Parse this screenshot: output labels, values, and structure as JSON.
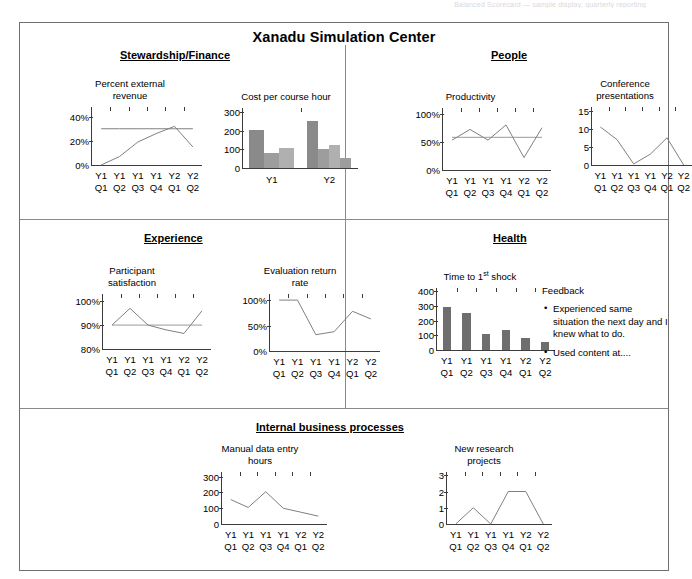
{
  "faint_header": "Balanced Scorecard — sample display, quarterly reporting",
  "dashboard": {
    "title": "Xanadu Simulation Center",
    "sections": [
      {
        "id": "stewardship",
        "label": "Stewardship/Finance"
      },
      {
        "id": "people",
        "label": "People"
      },
      {
        "id": "experience",
        "label": "Experience"
      },
      {
        "id": "health",
        "label": "Health"
      },
      {
        "id": "internal",
        "label": "Internal business processes"
      }
    ]
  },
  "feedback": {
    "title": "Feedback",
    "items": [
      "Experienced same situation the next day and I knew what to do.",
      "Used content at...."
    ]
  },
  "chart_data": [
    {
      "id": "percent-external-revenue",
      "type": "line",
      "title": "Percent external\nrevenue",
      "categories": [
        "Y1\nQ1",
        "Y1\nQ2",
        "Y1\nQ3",
        "Y1\nQ4",
        "Y2\nQ1",
        "Y2\nQ2"
      ],
      "yticks": [
        0,
        20,
        40
      ],
      "yticklabels": [
        "0%",
        "20%",
        "40%"
      ],
      "ylim": [
        0,
        48
      ],
      "series": [
        {
          "name": "target",
          "values": [
            30,
            30,
            30,
            30,
            30,
            30
          ],
          "color": "#808080"
        },
        {
          "name": "actual",
          "values": [
            0,
            7,
            19,
            26,
            32,
            15
          ],
          "color": "#808080"
        }
      ]
    },
    {
      "id": "cost-per-course-hour",
      "type": "bar",
      "title": "Cost per course hour",
      "categories": [
        "Y1",
        "Y2"
      ],
      "yticks": [
        0,
        100,
        200,
        300
      ],
      "yticklabels": [
        "0",
        "100",
        "200",
        "300"
      ],
      "ylim": [
        0,
        320
      ],
      "groups": [
        {
          "name": "Y1",
          "values": [
            205,
            80,
            105
          ],
          "colors": [
            "#8a8a8a",
            "#9d9d9d",
            "#b0b0b0"
          ]
        },
        {
          "name": "Y2",
          "values": [
            250,
            103,
            125,
            55
          ],
          "colors": [
            "#8a8a8a",
            "#9d9d9d",
            "#b0b0b0",
            "#9d9d9d"
          ]
        }
      ]
    },
    {
      "id": "productivity",
      "type": "line",
      "title": "Productivity",
      "categories": [
        "Y1\nQ1",
        "Y1\nQ2",
        "Y1\nQ3",
        "Y1\nQ4",
        "Y2\nQ1",
        "Y2\nQ2"
      ],
      "yticks": [
        0,
        50,
        100
      ],
      "yticklabels": [
        "0%",
        "50%",
        "100%"
      ],
      "ylim": [
        0,
        110
      ],
      "series": [
        {
          "name": "target",
          "values": [
            58,
            58,
            58,
            58,
            58,
            58
          ],
          "color": "#9a9a9a"
        },
        {
          "name": "actual",
          "values": [
            53,
            72,
            53,
            80,
            22,
            75
          ],
          "color": "#808080"
        }
      ]
    },
    {
      "id": "conference-presentations",
      "type": "line",
      "title": "Conference\npresentations",
      "categories": [
        "Y1\nQ1",
        "Y1\nQ2",
        "Y1\nQ3",
        "Y1\nQ4",
        "Y2\nQ1",
        "Y2\nQ2"
      ],
      "yticks": [
        0,
        5,
        10,
        15
      ],
      "yticklabels": [
        "0",
        "5",
        "10",
        "15"
      ],
      "ylim": [
        0,
        16
      ],
      "series": [
        {
          "name": "presentations",
          "values": [
            10.5,
            7,
            0.3,
            3,
            7.5,
            0
          ],
          "color": "#808080"
        }
      ]
    },
    {
      "id": "participant-satisfaction",
      "type": "line",
      "title": "Participant\nsatisfaction",
      "categories": [
        "Y1\nQ1",
        "Y1\nQ2",
        "Y1\nQ3",
        "Y1\nQ4",
        "Y2\nQ1",
        "Y2\nQ2"
      ],
      "yticks": [
        80,
        90,
        100
      ],
      "yticklabels": [
        "80%",
        "90%",
        "100%"
      ],
      "ylim": [
        80,
        103
      ],
      "series": [
        {
          "name": "target",
          "values": [
            90,
            90,
            90,
            90,
            90,
            90
          ],
          "color": "#9a9a9a"
        },
        {
          "name": "actual",
          "values": [
            90,
            97,
            90,
            88,
            86.5,
            96
          ],
          "color": "#808080"
        }
      ]
    },
    {
      "id": "evaluation-return-rate",
      "type": "line",
      "title": "Evaluation return\nrate",
      "categories": [
        "Y1\nQ1",
        "Y1\nQ2",
        "Y1\nQ3",
        "Y1\nQ4",
        "Y2\nQ1",
        "Y2\nQ2"
      ],
      "yticks": [
        0,
        50,
        100
      ],
      "yticklabels": [
        "0%",
        "50%",
        "100%"
      ],
      "ylim": [
        0,
        112
      ],
      "series": [
        {
          "name": "return rate",
          "values": [
            100,
            100,
            32,
            38,
            78,
            63
          ],
          "color": "#808080"
        }
      ]
    },
    {
      "id": "time-to-first-shock",
      "type": "bar",
      "title": "Time to 1st shock",
      "categories": [
        "Y1\nQ1",
        "Y1\nQ2",
        "Y1\nQ3",
        "Y1\nQ4",
        "Y2\nQ1",
        "Y2\nQ2"
      ],
      "yticks": [
        0,
        100,
        200,
        300,
        400
      ],
      "yticklabels": [
        "0",
        "100",
        "200",
        "300",
        "400"
      ],
      "ylim": [
        0,
        420
      ],
      "values": [
        290,
        250,
        110,
        135,
        85,
        55
      ],
      "bar_color": "#6e6e6e"
    },
    {
      "id": "manual-data-entry-hours",
      "type": "line",
      "title": "Manual data entry\nhours",
      "categories": [
        "Y1\nQ1",
        "Y1\nQ2",
        "Y1\nQ3",
        "Y1\nQ4",
        "Y2\nQ1",
        "Y2\nQ2"
      ],
      "yticks": [
        0,
        100,
        200,
        300
      ],
      "yticklabels": [
        "0",
        "100",
        "200",
        "300"
      ],
      "ylim": [
        0,
        330
      ],
      "series": [
        {
          "name": "hours",
          "values": [
            155,
            105,
            205,
            100,
            75,
            50
          ],
          "color": "#808080"
        }
      ]
    },
    {
      "id": "new-research-projects",
      "type": "line",
      "title": "New research\nprojects",
      "categories": [
        "Y1\nQ1",
        "Y1\nQ2",
        "Y1\nQ3",
        "Y1\nQ4",
        "Y2\nQ1",
        "Y2\nQ2"
      ],
      "yticks": [
        0,
        1,
        2,
        3
      ],
      "yticklabels": [
        "0",
        "1",
        "2",
        "3"
      ],
      "ylim": [
        0,
        3.2
      ],
      "series": [
        {
          "name": "projects",
          "values": [
            0,
            1,
            0,
            2,
            2,
            0
          ],
          "color": "#808080"
        }
      ]
    }
  ]
}
